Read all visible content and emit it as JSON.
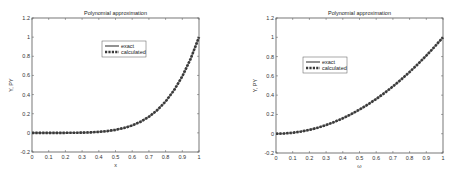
{
  "chart_data": [
    {
      "type": "line",
      "title": "Polynomial approximation",
      "xlabel": "x",
      "ylabel": "Y, PY",
      "xlim": [
        0,
        1
      ],
      "ylim": [
        -0.2,
        1.2
      ],
      "xticks": [
        "0",
        "0.1",
        "0.2",
        "0.3",
        "0.4",
        "0.5",
        "0.6",
        "0.7",
        "0.8",
        "0.9",
        "1"
      ],
      "yticks": [
        "-0.2",
        "0",
        "0.2",
        "0.4",
        "0.6",
        "0.8",
        "1",
        "1.2"
      ],
      "grid": false,
      "legend_position": "upper-center",
      "x": [
        0,
        0.05,
        0.1,
        0.15,
        0.2,
        0.25,
        0.3,
        0.35,
        0.4,
        0.45,
        0.5,
        0.55,
        0.6,
        0.65,
        0.7,
        0.75,
        0.8,
        0.85,
        0.9,
        0.95,
        1.0
      ],
      "series": [
        {
          "name": "exact",
          "style": "solid",
          "values": [
            0,
            0,
            0,
            0.0001,
            0.0003,
            0.001,
            0.0024,
            0.0053,
            0.0102,
            0.0185,
            0.0313,
            0.0503,
            0.0778,
            0.116,
            0.1681,
            0.2373,
            0.3277,
            0.4437,
            0.5905,
            0.7738,
            1.0
          ]
        },
        {
          "name": "calculated",
          "style": "dashed",
          "values": [
            0,
            0,
            0,
            0.0001,
            0.0003,
            0.001,
            0.0024,
            0.0053,
            0.0102,
            0.0185,
            0.0313,
            0.0503,
            0.0778,
            0.116,
            0.1681,
            0.2373,
            0.3277,
            0.4437,
            0.5905,
            0.7738,
            1.0
          ]
        }
      ]
    },
    {
      "type": "line",
      "title": "Polynomial approximation",
      "xlabel": "ω",
      "ylabel": "Y, PY",
      "xlim": [
        0,
        1
      ],
      "ylim": [
        -0.2,
        1.2
      ],
      "xticks": [
        "0",
        "0.1",
        "0.2",
        "0.3",
        "0.4",
        "0.5",
        "0.6",
        "0.7",
        "0.8",
        "0.9",
        "1"
      ],
      "yticks": [
        "-0.2",
        "0",
        "0.2",
        "0.4",
        "0.6",
        "0.8",
        "1",
        "1.2"
      ],
      "grid": false,
      "legend_position": "upper-left",
      "x": [
        0,
        0.05,
        0.1,
        0.15,
        0.2,
        0.25,
        0.3,
        0.35,
        0.4,
        0.45,
        0.5,
        0.55,
        0.6,
        0.65,
        0.7,
        0.75,
        0.8,
        0.85,
        0.9,
        0.95,
        1.0
      ],
      "series": [
        {
          "name": "exact",
          "style": "solid",
          "values": [
            0,
            0.0025,
            0.01,
            0.0225,
            0.04,
            0.0625,
            0.09,
            0.1225,
            0.16,
            0.2025,
            0.25,
            0.3025,
            0.36,
            0.4225,
            0.49,
            0.5625,
            0.64,
            0.7225,
            0.81,
            0.9025,
            1.0
          ]
        },
        {
          "name": "calculated",
          "style": "dashed",
          "values": [
            0,
            0.0025,
            0.01,
            0.0225,
            0.04,
            0.0625,
            0.09,
            0.1225,
            0.16,
            0.2025,
            0.25,
            0.3025,
            0.36,
            0.4225,
            0.49,
            0.5625,
            0.64,
            0.7225,
            0.81,
            0.9025,
            1.0
          ]
        }
      ]
    }
  ]
}
